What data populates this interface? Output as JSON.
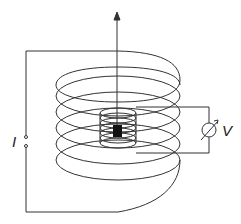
{
  "diagram": {
    "labels": {
      "current": "I",
      "voltage": "V"
    },
    "colors": {
      "stroke": "#333333",
      "sample": "#111111",
      "background": "#ffffff"
    },
    "components": [
      "outer-solenoid",
      "inner-pickup-coil",
      "sample-block",
      "field-axis-arrow",
      "current-source-terminals",
      "voltmeter"
    ]
  }
}
